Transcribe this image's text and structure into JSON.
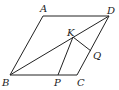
{
  "diagram": {
    "type": "geometry",
    "points": {
      "A": {
        "label": "A",
        "x": 43,
        "y": 16
      },
      "D": {
        "label": "D",
        "x": 109,
        "y": 16
      },
      "B": {
        "label": "B",
        "x": 10,
        "y": 75
      },
      "C": {
        "label": "C",
        "x": 77,
        "y": 75
      },
      "K": {
        "label": "K",
        "x": 73,
        "y": 37
      },
      "P": {
        "label": "P",
        "x": 58,
        "y": 75
      },
      "Q": {
        "label": "Q",
        "x": 91,
        "y": 51
      }
    },
    "segments": [
      "AB",
      "BC",
      "CD",
      "DA",
      "BD",
      "KP",
      "KQ"
    ],
    "stroke_color": "#222222"
  }
}
